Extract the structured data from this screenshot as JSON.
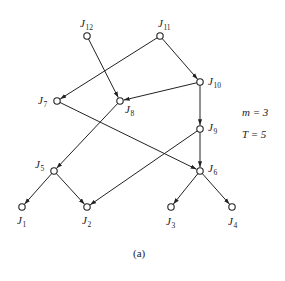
{
  "figure": {
    "caption": "(a)",
    "params": [
      {
        "name": "m",
        "text": "m = 3"
      },
      {
        "name": "T",
        "text": "T = 5"
      }
    ]
  },
  "graph": {
    "nodes": [
      {
        "id": "J12",
        "label": "J",
        "sub": "12",
        "x": 87,
        "y": 36,
        "lx": 80,
        "ly": 27,
        "anchor": "middle"
      },
      {
        "id": "J11",
        "label": "J",
        "sub": "11",
        "x": 160,
        "y": 36,
        "lx": 158,
        "ly": 27,
        "anchor": "middle"
      },
      {
        "id": "J10",
        "label": "J",
        "sub": "10",
        "x": 200,
        "y": 82,
        "lx": 208,
        "ly": 85,
        "anchor": "start"
      },
      {
        "id": "J7",
        "label": "J",
        "sub": "7",
        "x": 57,
        "y": 101,
        "lx": 38,
        "ly": 104,
        "anchor": "start"
      },
      {
        "id": "J8",
        "label": "J",
        "sub": "8",
        "x": 120,
        "y": 101,
        "lx": 125,
        "ly": 113,
        "anchor": "start"
      },
      {
        "id": "J9",
        "label": "J",
        "sub": "9",
        "x": 200,
        "y": 129,
        "lx": 208,
        "ly": 131,
        "anchor": "start"
      },
      {
        "id": "J5",
        "label": "J",
        "sub": "5",
        "x": 54,
        "y": 171,
        "lx": 35,
        "ly": 168,
        "anchor": "start"
      },
      {
        "id": "J6",
        "label": "J",
        "sub": "6",
        "x": 200,
        "y": 171,
        "lx": 208,
        "ly": 172,
        "anchor": "start"
      },
      {
        "id": "J1",
        "label": "J",
        "sub": "1",
        "x": 22,
        "y": 207,
        "lx": 17,
        "ly": 224,
        "anchor": "start"
      },
      {
        "id": "J2",
        "label": "J",
        "sub": "2",
        "x": 87,
        "y": 207,
        "lx": 82,
        "ly": 224,
        "anchor": "start"
      },
      {
        "id": "J3",
        "label": "J",
        "sub": "3",
        "x": 171,
        "y": 207,
        "lx": 166,
        "ly": 225,
        "anchor": "start"
      },
      {
        "id": "J4",
        "label": "J",
        "sub": "4",
        "x": 232,
        "y": 207,
        "lx": 228,
        "ly": 225,
        "anchor": "start"
      }
    ],
    "edges": [
      {
        "from": "J12",
        "to": "J8"
      },
      {
        "from": "J11",
        "to": "J7"
      },
      {
        "from": "J11",
        "to": "J10"
      },
      {
        "from": "J10",
        "to": "J8"
      },
      {
        "from": "J10",
        "to": "J9"
      },
      {
        "from": "J7",
        "to": "J6"
      },
      {
        "from": "J8",
        "to": "J5"
      },
      {
        "from": "J9",
        "to": "J6"
      },
      {
        "from": "J9",
        "to": "J2"
      },
      {
        "from": "J5",
        "to": "J1"
      },
      {
        "from": "J5",
        "to": "J2"
      },
      {
        "from": "J6",
        "to": "J3"
      },
      {
        "from": "J6",
        "to": "J4"
      }
    ]
  }
}
